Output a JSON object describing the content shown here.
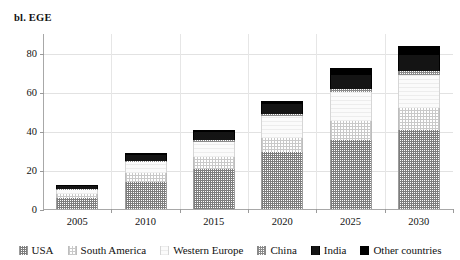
{
  "chart_data": {
    "type": "bar",
    "subtype": "stacked-column",
    "title": "",
    "ylabel": "bl. EGE",
    "xlabel": "",
    "ylim": [
      0,
      90
    ],
    "yticks": [
      0,
      20,
      40,
      60,
      80
    ],
    "grid": true,
    "grid_axis": "both",
    "legend_position": "bottom",
    "categories": [
      "2005",
      "2010",
      "2015",
      "2020",
      "2025",
      "2030"
    ],
    "series": [
      {
        "name": "USA",
        "fill": "dense-stipple",
        "color": "#7d7d7d",
        "values": [
          5.5,
          14.0,
          20.5,
          29.0,
          35.5,
          40.5
        ]
      },
      {
        "name": "South America",
        "fill": "light-stipple",
        "color": "#c9c9c9",
        "values": [
          2.0,
          4.5,
          6.0,
          7.5,
          9.5,
          11.0
        ]
      },
      {
        "name": "Western Europe",
        "fill": "very-light",
        "color": "#f2f2f2",
        "values": [
          2.0,
          5.5,
          8.0,
          11.0,
          15.0,
          17.0
        ]
      },
      {
        "name": "China",
        "fill": "medium-gray",
        "color": "#8a8a8a",
        "values": [
          0.5,
          0.8,
          1.0,
          1.2,
          1.5,
          2.0
        ]
      },
      {
        "name": "India",
        "fill": "black",
        "color": "#141414",
        "values": [
          2.0,
          3.0,
          4.0,
          5.0,
          7.0,
          8.5
        ]
      },
      {
        "name": "Other countries",
        "fill": "solid-black",
        "color": "#000000",
        "values": [
          0.5,
          0.7,
          1.0,
          1.3,
          3.5,
          4.5
        ]
      }
    ],
    "totals": [
      12.5,
      28.5,
      40.5,
      55.0,
      72.0,
      83.5
    ]
  },
  "axis": {
    "y_title": "bl. EGE",
    "y_tick_labels": [
      "0",
      "20",
      "40",
      "60",
      "80"
    ],
    "x_tick_labels": [
      "2005",
      "2010",
      "2015",
      "2020",
      "2025",
      "2030"
    ]
  },
  "legend": {
    "items": [
      {
        "label": "USA"
      },
      {
        "label": "South America"
      },
      {
        "label": "Western Europe"
      },
      {
        "label": "China"
      },
      {
        "label": "India"
      },
      {
        "label": "Other countries"
      }
    ]
  }
}
